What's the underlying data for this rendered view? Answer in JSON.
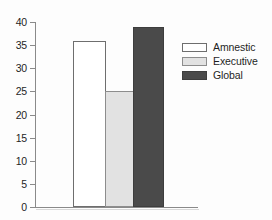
{
  "chart_data": {
    "type": "bar",
    "title": "",
    "xlabel": "",
    "ylabel": "",
    "categories": [
      "Amnestic",
      "Executive",
      "Global"
    ],
    "values": [
      36,
      25,
      39
    ],
    "series": [
      {
        "name": "Amnestic",
        "value": 36,
        "color": "#ffffff"
      },
      {
        "name": "Executive",
        "value": 25,
        "color": "#e2e2e2"
      },
      {
        "name": "Global",
        "value": 39,
        "color": "#4a4a4a"
      }
    ],
    "ylim": [
      0,
      40
    ],
    "yticks": [
      0,
      5,
      10,
      15,
      20,
      25,
      30,
      35,
      40
    ],
    "ytick_labels": [
      "0",
      "5",
      "10",
      "15",
      "20",
      "25",
      "30",
      "35",
      "40"
    ],
    "xtick_labels": [],
    "grid": false,
    "legend_position": "right",
    "legend": [
      "Amnestic",
      "Executive",
      "Global"
    ]
  },
  "axis": {
    "ticks": [
      {
        "label": "40",
        "value": 40
      },
      {
        "label": "35",
        "value": 35
      },
      {
        "label": "30",
        "value": 30
      },
      {
        "label": "25",
        "value": 25
      },
      {
        "label": "20",
        "value": 20
      },
      {
        "label": "15",
        "value": 15
      },
      {
        "label": "10",
        "value": 10
      },
      {
        "label": "5",
        "value": 5
      },
      {
        "label": "0",
        "value": 0
      }
    ]
  },
  "legend": {
    "items": [
      {
        "label": "Amnestic",
        "swatch": "white-swatch"
      },
      {
        "label": "Executive",
        "swatch": "light-gray-swatch"
      },
      {
        "label": "Global",
        "swatch": "dark-gray-swatch"
      }
    ]
  },
  "colors": {
    "amnestic": "#ffffff",
    "executive": "#e2e2e2",
    "global": "#4a4a4a",
    "axis": "#8a8a8a",
    "text": "#1f1f1f",
    "background": "#fdfdfd"
  }
}
